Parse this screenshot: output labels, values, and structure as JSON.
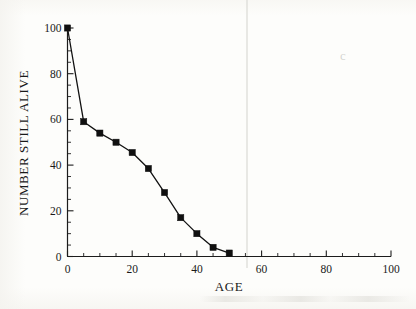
{
  "figure": {
    "kind": "scanned-figure",
    "background_color": "#fdfdfb",
    "ink_color": "#111111"
  },
  "chart_data": {
    "type": "line",
    "title": "",
    "subtitle": "",
    "xlabel": "AGE",
    "ylabel": "NUMBER STILL ALIVE",
    "xlim": [
      0,
      100
    ],
    "ylim": [
      0,
      100
    ],
    "grid": false,
    "legend": null,
    "legend_position": "none",
    "marker": "filled-square",
    "x_major_ticks": [
      0,
      20,
      40,
      60,
      80,
      100
    ],
    "x_minor_tick_step": 5,
    "y_major_ticks": [
      0,
      20,
      40,
      60,
      80,
      100
    ],
    "y_minor_tick_step": 5,
    "x_tick_labels": [
      "0",
      "20",
      "40",
      "60",
      "80",
      "100"
    ],
    "y_tick_labels": [
      "0",
      "20",
      "40",
      "60",
      "80",
      "100"
    ],
    "x": [
      0,
      5,
      10,
      15,
      20,
      25,
      30,
      35,
      40,
      45,
      50
    ],
    "values": [
      100,
      59,
      54,
      50,
      45.5,
      38.5,
      28,
      17,
      10,
      4,
      1.5
    ],
    "series": [
      {
        "name": "survivorship",
        "points": [
          {
            "x": 0,
            "y": 100
          },
          {
            "x": 5,
            "y": 59
          },
          {
            "x": 10,
            "y": 54
          },
          {
            "x": 15,
            "y": 50
          },
          {
            "x": 20,
            "y": 45.5
          },
          {
            "x": 25,
            "y": 38.5
          },
          {
            "x": 30,
            "y": 28
          },
          {
            "x": 35,
            "y": 17
          },
          {
            "x": 40,
            "y": 10
          },
          {
            "x": 45,
            "y": 4
          },
          {
            "x": 50,
            "y": 1.5
          }
        ]
      }
    ]
  },
  "artifacts": {
    "right_smudge_glyph": "c"
  }
}
